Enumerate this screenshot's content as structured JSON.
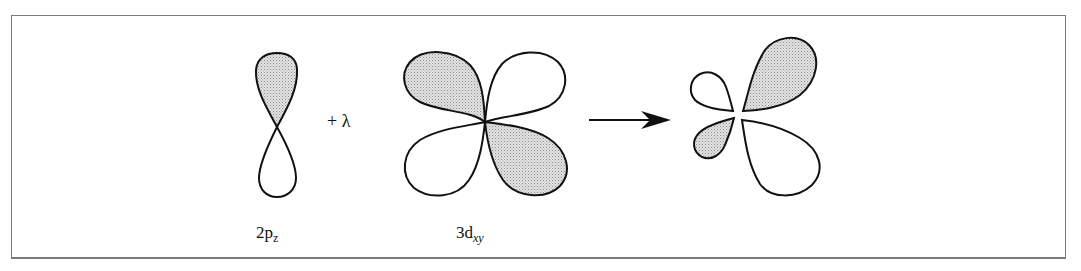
{
  "diagram": {
    "terms": [
      {
        "name": "2p",
        "subscript": "z"
      },
      {
        "operator": "+ λ"
      },
      {
        "name": "3d",
        "subscript": "xy"
      }
    ],
    "labels": {
      "p_orbital_main": "2p",
      "p_orbital_sub": "z",
      "plus_lambda": "+ λ",
      "d_orbital_main": "3d",
      "d_orbital_sub": "xy"
    },
    "colors": {
      "stroke": "#111111",
      "shade": "#d6d6d6",
      "frame": "#7a7a7a"
    }
  }
}
